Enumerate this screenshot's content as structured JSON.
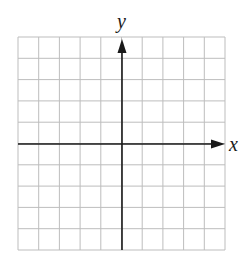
{
  "diagram": {
    "type": "coordinate-grid",
    "x_axis_label": "x",
    "y_axis_label": "y",
    "grid": {
      "columns": 10,
      "rows": 10,
      "left": 18,
      "top": 37,
      "right": 225,
      "bottom": 250
    },
    "origin": {
      "px": 122,
      "py": 144
    },
    "colors": {
      "grid": "#bdbdbd",
      "axis": "#1a1a1a",
      "background": "#ffffff"
    }
  }
}
